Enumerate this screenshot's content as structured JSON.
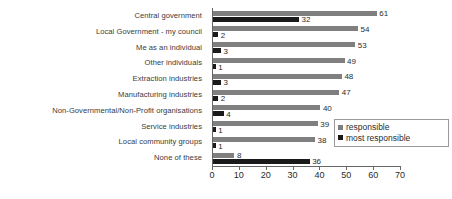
{
  "chart_data": {
    "type": "bar",
    "orientation": "horizontal",
    "title": "",
    "subtitle": "",
    "xlabel": "",
    "ylabel": "",
    "xlim": [
      0,
      70
    ],
    "xticks": [
      0,
      10,
      20,
      30,
      40,
      50,
      60,
      70
    ],
    "grid": false,
    "legend_position": "inside-lower-right",
    "categories": [
      "Central government",
      "Local Government - my council",
      "Me as an individual",
      "Other individuals",
      "Extraction industries",
      "Manufacturing industries",
      "Non-Governmental/Non-Profit organisations",
      "Service industries",
      "Local community groups",
      "None of these"
    ],
    "series": [
      {
        "name": "responsible",
        "color": "#7f7f7f",
        "values": [
          61,
          54,
          53,
          49,
          48,
          47,
          40,
          39,
          38,
          8
        ]
      },
      {
        "name": "most responsible",
        "color": "#1a1a1a",
        "values": [
          32,
          2,
          3,
          1,
          3,
          2,
          4,
          1,
          1,
          36
        ]
      }
    ]
  },
  "legend": {
    "items": [
      {
        "label": "responsible",
        "color": "#7f7f7f"
      },
      {
        "label": "most responsible",
        "color": "#1a1a1a"
      }
    ]
  },
  "axis": {
    "tick_labels": [
      "0",
      "10",
      "20",
      "30",
      "40",
      "50",
      "60",
      "70"
    ]
  }
}
